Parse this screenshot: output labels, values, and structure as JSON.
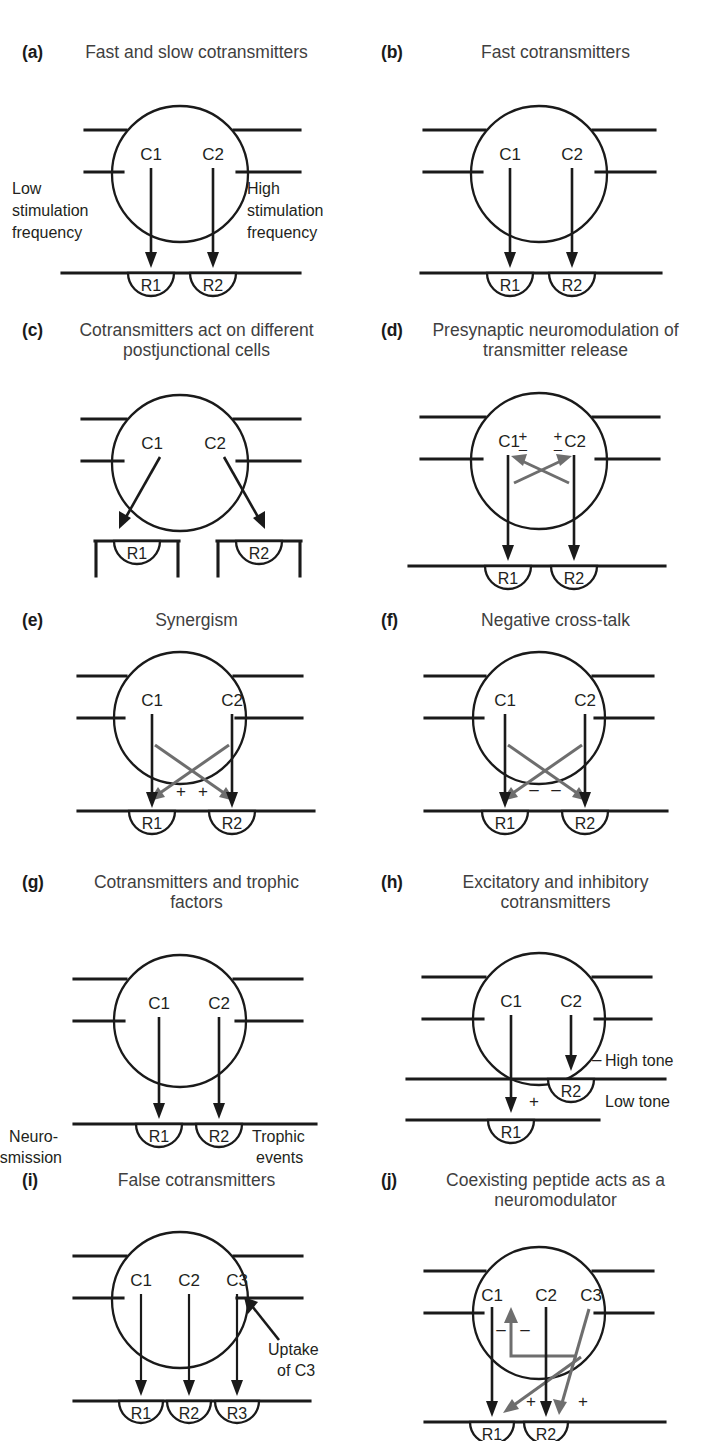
{
  "figure": {
    "background": "#ffffff",
    "ink_color": "#1a1a1a",
    "title_color": "#3f3f3f",
    "modulator_color": "#6e6e6e"
  },
  "panels": [
    {
      "letter": "(a)",
      "title": "Fast and slow cotransmitters",
      "transmitters": [
        "C1",
        "C2"
      ],
      "receptors": [
        "R1",
        "R2"
      ],
      "notes": {
        "left": "Low\nstimulation\nfrequency",
        "right": "High\nstimulation\nfrequency"
      },
      "left_note_line1": "Low",
      "left_note_line2": "stimulation",
      "left_note_line3": "frequency",
      "right_note_line1": "High",
      "right_note_line2": "stimulation",
      "right_note_line3": "frequency"
    },
    {
      "letter": "(b)",
      "title": "Fast cotransmitters",
      "transmitters": [
        "C1",
        "C2"
      ],
      "receptors": [
        "R1",
        "R2"
      ]
    },
    {
      "letter": "(c)",
      "title": "Cotransmitters act on different postjunctional cells",
      "transmitters": [
        "C1",
        "C2"
      ],
      "receptors": [
        "R1",
        "R2"
      ]
    },
    {
      "letter": "(d)",
      "title": "Presynaptic neuromodulation of transmitter release",
      "transmitters": [
        "C1",
        "C2"
      ],
      "receptors": [
        "R1",
        "R2"
      ],
      "sign_left_plus": "+",
      "sign_left_minus": "–",
      "sign_right_plus": "+",
      "sign_right_minus": "–"
    },
    {
      "letter": "(e)",
      "title": "Synergism",
      "transmitters": [
        "C1",
        "C2"
      ],
      "receptors": [
        "R1",
        "R2"
      ],
      "sign_left": "+",
      "sign_right": "+"
    },
    {
      "letter": "(f)",
      "title": "Negative cross-talk",
      "transmitters": [
        "C1",
        "C2"
      ],
      "receptors": [
        "R1",
        "R2"
      ],
      "sign_left": "–",
      "sign_right": "–"
    },
    {
      "letter": "(g)",
      "title": "Cotransmitters and trophic factors",
      "transmitters": [
        "C1",
        "C2"
      ],
      "receptors": [
        "R1",
        "R2"
      ],
      "left_note_line1": "Neuro-",
      "left_note_line2": "transmission",
      "right_note_line1": "Trophic",
      "right_note_line2": "events"
    },
    {
      "letter": "(h)",
      "title": "Excitatory and inhibitory cotransmitters",
      "transmitters": [
        "C1",
        "C2"
      ],
      "receptors": [
        "R1",
        "R2"
      ],
      "sign_high": "–",
      "label_high": "High tone",
      "sign_low": "+",
      "label_low": "Low tone"
    },
    {
      "letter": "(i)",
      "title": "False cotransmitters",
      "transmitters": [
        "C1",
        "C2",
        "C3"
      ],
      "receptors": [
        "R1",
        "R2",
        "R3"
      ],
      "uptake_line1": "Uptake",
      "uptake_line2": "of C3"
    },
    {
      "letter": "(j)",
      "title": "Coexisting peptide acts as a neuromodulator",
      "transmitters": [
        "C1",
        "C2",
        "C3"
      ],
      "receptors": [
        "R1",
        "R2"
      ],
      "sign_minus_1": "–",
      "sign_minus_2": "–",
      "sign_plus_1": "+",
      "sign_plus_2": "+"
    }
  ]
}
